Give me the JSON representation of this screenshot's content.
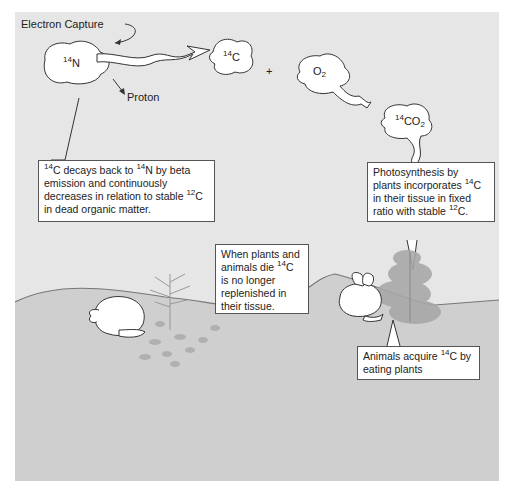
{
  "diagram": {
    "colors": {
      "sky": "#e6e6e6",
      "ground": "#cfcfcf",
      "ground_line": "#777777",
      "box_border": "#555555",
      "foliage": "#a8a8a8"
    },
    "labels": {
      "electron_capture": "Electron Capture",
      "proton": "Proton",
      "plus": "+"
    },
    "nodes": {
      "n14": {
        "sup": "14",
        "base": "N",
        "sub": ""
      },
      "c14": {
        "sup": "14",
        "base": "C",
        "sub": ""
      },
      "o2": {
        "sup": "",
        "base": "O",
        "sub": "2"
      },
      "co2": {
        "sup": "14",
        "base": "CO",
        "sub": "2"
      }
    },
    "callouts": {
      "decay": {
        "parts": [
          {
            "sup": "14",
            "text": "C decays back to "
          },
          {
            "sup": "14",
            "text": "N by beta emission and continuously decreases in relation to stable "
          },
          {
            "sup": "12",
            "text": "C in dead organic matter."
          }
        ]
      },
      "photosynthesis": {
        "parts": [
          {
            "sup": "",
            "text": "Photosynthesis by plants incorporates "
          },
          {
            "sup": "14",
            "text": "C in their tissue in fixed ratio with stable "
          },
          {
            "sup": "12",
            "text": "C."
          }
        ]
      },
      "death": {
        "parts": [
          {
            "sup": "",
            "text": "When plants and animals die "
          },
          {
            "sup": "14",
            "text": "C is no longer replenished in their tissue."
          }
        ]
      },
      "animals": {
        "parts": [
          {
            "sup": "",
            "text": "Animals acquire "
          },
          {
            "sup": "14",
            "text": "C by eating plants"
          }
        ]
      }
    }
  }
}
